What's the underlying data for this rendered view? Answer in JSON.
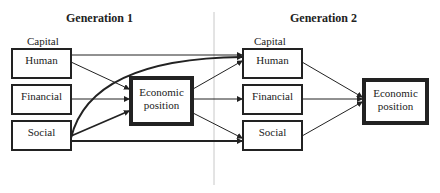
{
  "generation1": {
    "title": "Generation 1",
    "capital_label": "Capital",
    "capitals": [
      {
        "label": "Human"
      },
      {
        "label": "Financial"
      },
      {
        "label": "Social"
      }
    ],
    "outcome": {
      "label": "Economic position"
    }
  },
  "generation2": {
    "title": "Generation 2",
    "capital_label": "Capital",
    "capitals": [
      {
        "label": "Human"
      },
      {
        "label": "Financial"
      },
      {
        "label": "Social"
      }
    ],
    "outcome": {
      "label": "Economic position"
    }
  },
  "edges": [
    {
      "from": "gen1-human",
      "to": "gen1-economic-position"
    },
    {
      "from": "gen1-financial",
      "to": "gen1-economic-position"
    },
    {
      "from": "gen1-social",
      "to": "gen1-economic-position"
    },
    {
      "from": "gen1-human",
      "to": "gen2-human"
    },
    {
      "from": "gen1-social",
      "to": "gen2-human",
      "style": "curved-bold"
    },
    {
      "from": "gen1-social",
      "to": "gen2-social",
      "style": "bold"
    },
    {
      "from": "gen1-economic-position",
      "to": "gen2-human"
    },
    {
      "from": "gen1-economic-position",
      "to": "gen2-financial"
    },
    {
      "from": "gen1-economic-position",
      "to": "gen2-social"
    },
    {
      "from": "gen2-human",
      "to": "gen2-economic-position"
    },
    {
      "from": "gen2-financial",
      "to": "gen2-economic-position"
    },
    {
      "from": "gen2-social",
      "to": "gen2-economic-position"
    }
  ]
}
